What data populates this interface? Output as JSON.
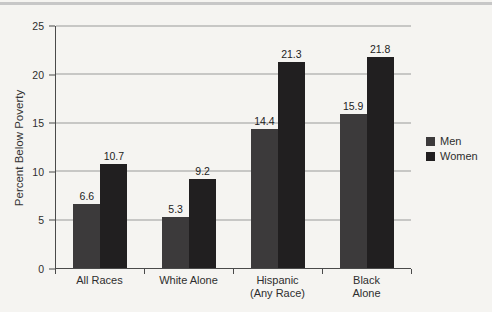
{
  "figure": {
    "y_axis_title": "Percent Below Poverty"
  },
  "chart_data": {
    "type": "bar",
    "title": "",
    "xlabel": "",
    "ylabel": "Percent Below Poverty",
    "categories": [
      "All Races",
      "White Alone",
      "Hispanic\n(Any Race)",
      "Black Alone"
    ],
    "series": [
      {
        "name": "Men",
        "color": "#3c3a3b",
        "values": [
          6.6,
          5.3,
          14.4,
          15.9
        ]
      },
      {
        "name": "Women",
        "color": "#211f20",
        "values": [
          10.7,
          9.2,
          21.3,
          21.8
        ]
      }
    ],
    "value_labels": [
      [
        "6.6",
        "5.3",
        "14.4",
        "15.9"
      ],
      [
        "10.7",
        "9.2",
        "21.3",
        "21.8"
      ]
    ],
    "ylim": [
      0,
      25
    ],
    "yticks": [
      0,
      5,
      10,
      15,
      20,
      25
    ],
    "ytick_labels": [
      "0",
      "5",
      "10",
      "15",
      "20",
      "25"
    ],
    "grid": true,
    "legend_position": "right",
    "legend": [
      "Men",
      "Women"
    ]
  }
}
